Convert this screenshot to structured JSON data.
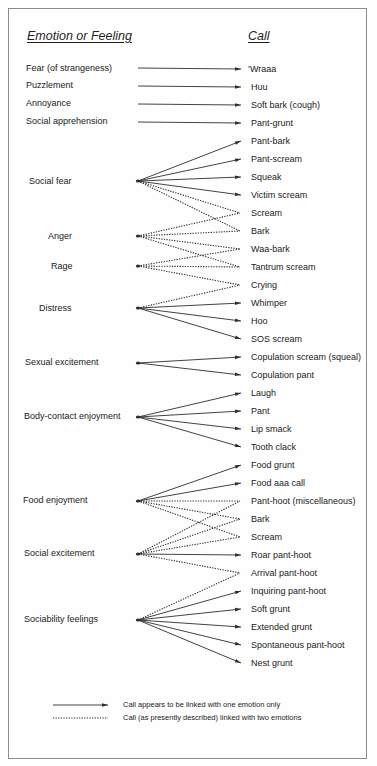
{
  "headers": {
    "emotion": "Emotion or Feeling",
    "call": "Call"
  },
  "emotions": [
    {
      "label": "Fear (of strangeness)"
    },
    {
      "label": "Puzzlement"
    },
    {
      "label": "Annoyance"
    },
    {
      "label": "Social apprehension"
    },
    {
      "label": "Social fear"
    },
    {
      "label": "Anger"
    },
    {
      "label": "Rage"
    },
    {
      "label": "Distress"
    },
    {
      "label": "Sexual excitement"
    },
    {
      "label": "Body-contact enjoyment"
    },
    {
      "label": "Food enjoyment"
    },
    {
      "label": "Social excitement"
    },
    {
      "label": "Sociability feelings"
    }
  ],
  "calls": [
    {
      "label": "Wraaa",
      "marker": "*"
    },
    {
      "label": "Huu"
    },
    {
      "label": "Soft bark (cough)"
    },
    {
      "label": "Pant-grunt"
    },
    {
      "label": "Pant-bark"
    },
    {
      "label": "Pant-scream"
    },
    {
      "label": "Squeak"
    },
    {
      "label": "Victim scream"
    },
    {
      "label": "Scream"
    },
    {
      "label": "Bark"
    },
    {
      "label": "Waa-bark"
    },
    {
      "label": "Tantrum scream"
    },
    {
      "label": "Crying"
    },
    {
      "label": "Whimper"
    },
    {
      "label": "Hoo"
    },
    {
      "label": "SOS scream"
    },
    {
      "label": "Copulation scream (squeal)"
    },
    {
      "label": "Copulation pant"
    },
    {
      "label": "Laugh"
    },
    {
      "label": "Pant"
    },
    {
      "label": "Lip smack"
    },
    {
      "label": "Tooth clack"
    },
    {
      "label": "Food grunt"
    },
    {
      "label": "Food aaa call"
    },
    {
      "label": "Pant-hoot (miscellaneous)"
    },
    {
      "label": "Bark"
    },
    {
      "label": "Scream"
    },
    {
      "label": "Roar pant-hoot"
    },
    {
      "label": "Arrival pant-hoot"
    },
    {
      "label": "Inquiring pant-hoot"
    },
    {
      "label": "Soft grunt"
    },
    {
      "label": "Extended grunt"
    },
    {
      "label": "Spontaneous pant-hoot"
    },
    {
      "label": "Nest grunt"
    }
  ],
  "links": [
    {
      "from": 0,
      "to": 0,
      "style": "solid"
    },
    {
      "from": 1,
      "to": 1,
      "style": "solid"
    },
    {
      "from": 2,
      "to": 2,
      "style": "solid"
    },
    {
      "from": 3,
      "to": 3,
      "style": "solid"
    },
    {
      "from": 4,
      "to": 4,
      "style": "solid"
    },
    {
      "from": 4,
      "to": 5,
      "style": "solid"
    },
    {
      "from": 4,
      "to": 6,
      "style": "solid"
    },
    {
      "from": 4,
      "to": 7,
      "style": "solid"
    },
    {
      "from": 4,
      "to": 8,
      "style": "dotted"
    },
    {
      "from": 4,
      "to": 9,
      "style": "dotted"
    },
    {
      "from": 5,
      "to": 8,
      "style": "dotted"
    },
    {
      "from": 5,
      "to": 9,
      "style": "dotted"
    },
    {
      "from": 5,
      "to": 10,
      "style": "dotted"
    },
    {
      "from": 5,
      "to": 11,
      "style": "dotted"
    },
    {
      "from": 6,
      "to": 10,
      "style": "dotted"
    },
    {
      "from": 6,
      "to": 11,
      "style": "dotted"
    },
    {
      "from": 6,
      "to": 12,
      "style": "dotted"
    },
    {
      "from": 7,
      "to": 12,
      "style": "dotted"
    },
    {
      "from": 7,
      "to": 13,
      "style": "solid"
    },
    {
      "from": 7,
      "to": 14,
      "style": "solid"
    },
    {
      "from": 7,
      "to": 15,
      "style": "solid"
    },
    {
      "from": 8,
      "to": 16,
      "style": "solid"
    },
    {
      "from": 8,
      "to": 17,
      "style": "solid"
    },
    {
      "from": 9,
      "to": 18,
      "style": "solid"
    },
    {
      "from": 9,
      "to": 19,
      "style": "solid"
    },
    {
      "from": 9,
      "to": 20,
      "style": "solid"
    },
    {
      "from": 9,
      "to": 21,
      "style": "solid"
    },
    {
      "from": 10,
      "to": 22,
      "style": "solid"
    },
    {
      "from": 10,
      "to": 23,
      "style": "solid"
    },
    {
      "from": 10,
      "to": 24,
      "style": "dotted"
    },
    {
      "from": 10,
      "to": 25,
      "style": "dotted"
    },
    {
      "from": 10,
      "to": 26,
      "style": "dotted"
    },
    {
      "from": 11,
      "to": 24,
      "style": "dotted"
    },
    {
      "from": 11,
      "to": 25,
      "style": "dotted"
    },
    {
      "from": 11,
      "to": 26,
      "style": "dotted"
    },
    {
      "from": 11,
      "to": 27,
      "style": "solid"
    },
    {
      "from": 11,
      "to": 28,
      "style": "dotted"
    },
    {
      "from": 12,
      "to": 28,
      "style": "dotted"
    },
    {
      "from": 12,
      "to": 29,
      "style": "solid"
    },
    {
      "from": 12,
      "to": 30,
      "style": "solid"
    },
    {
      "from": 12,
      "to": 31,
      "style": "solid"
    },
    {
      "from": 12,
      "to": 32,
      "style": "solid"
    },
    {
      "from": 12,
      "to": 33,
      "style": "solid"
    }
  ],
  "legend": {
    "solid": "Call appears to be linked with one emotion only",
    "dotted": "Call (as presently described) linked with two emotions"
  },
  "colors": {
    "line": "#2e2e2e",
    "frame": "#8c8c8c",
    "text": "#222222"
  }
}
